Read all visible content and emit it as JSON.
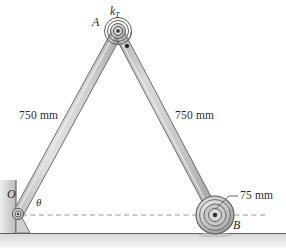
{
  "figure": {
    "background_color": "#ffffff",
    "width": 286,
    "height": 250
  },
  "labels": {
    "apex_point": "A",
    "spring_symbol": "k",
    "spring_subscript": "T",
    "pivot_point": "O",
    "roller_point": "B",
    "angle": "θ",
    "left_link_length": "750 mm",
    "right_link_length": "750 mm",
    "roller_radius": "75 mm"
  },
  "geometry": {
    "pivot_O": {
      "x": 18,
      "y": 214
    },
    "apex_A": {
      "x": 118,
      "y": 31
    },
    "roller_B": {
      "x": 215,
      "y": 215
    },
    "roller_outer_radius": 19,
    "link_half_width": 5,
    "datum_line_y": 215,
    "datum_line_x_start": 22,
    "datum_line_x_end": 268,
    "ground_line_y": 233,
    "wall_line_x": 16,
    "wall_top_y": 180,
    "spring_rings": [
      4.5,
      7.5,
      10.5,
      13.5
    ],
    "roller_rings": [
      19,
      15.5,
      11,
      6.5,
      2
    ]
  },
  "colors": {
    "link_fill": "#c9c9c9",
    "link_fill_light": "#dedede",
    "link_stroke": "#6e6e6e",
    "outline": "#4a4a4a",
    "text": "#2b2b2b",
    "ground_shade": "#d4d4d4",
    "wall_shade": "#c4c4c4",
    "dash_line": "#8a8a8a",
    "hub_dark": "#2e2e2e"
  }
}
